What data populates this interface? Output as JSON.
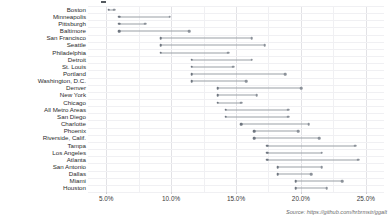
{
  "chart_data": {
    "type": "dumbbell",
    "title": "",
    "subtitle": "",
    "xlabel": "",
    "ylabel": "",
    "xlim": [
      3.6,
      26.4
    ],
    "xticks": [
      5.0,
      10.0,
      15.0,
      20.0,
      25.0
    ],
    "xtick_labels": [
      "5.0%",
      "10.0%",
      "15.0%",
      "20.0%",
      "25.0%"
    ],
    "grid": "vertical-major-minor-and-horizontal",
    "legend_position": "none",
    "series": [
      {
        "name": "start",
        "color": "#6f7680"
      },
      {
        "name": "end",
        "color": "#8b9199"
      }
    ],
    "categories": [
      "Boston",
      "Minneapolis",
      "Pittsburgh",
      "Baltimore",
      "San Francisco",
      "Seattle",
      "Philadelphia",
      "Detroit",
      "St. Louis",
      "Portland",
      "Washington, D.C.",
      "Denver",
      "New York",
      "Chicago",
      "All Metro Areas",
      "San Diego",
      "Charlotte",
      "Phoenix",
      "Riverside, Calif.",
      "Tampa",
      "Los Angeles",
      "Atlanta",
      "San Antonio",
      "Dallas",
      "Miami",
      "Houston"
    ],
    "rows": [
      {
        "city": "Boston",
        "start": 5.2,
        "end": 5.6
      },
      {
        "city": "Minneapolis",
        "start": 6.0,
        "end": 9.9
      },
      {
        "city": "Pittsburgh",
        "start": 6.0,
        "end": 8.0
      },
      {
        "city": "Baltimore",
        "start": 6.0,
        "end": 11.4
      },
      {
        "city": "San Francisco",
        "start": 9.2,
        "end": 16.2
      },
      {
        "city": "Seattle",
        "start": 9.2,
        "end": 17.2
      },
      {
        "city": "Philadelphia",
        "start": 9.2,
        "end": 14.4
      },
      {
        "city": "Detroit",
        "start": 11.6,
        "end": 16.2
      },
      {
        "city": "St. Louis",
        "start": 11.6,
        "end": 14.8
      },
      {
        "city": "Portland",
        "start": 11.6,
        "end": 18.8
      },
      {
        "city": "Washington, D.C.",
        "start": 11.6,
        "end": 15.8
      },
      {
        "city": "Denver",
        "start": 13.6,
        "end": 20.0
      },
      {
        "city": "New York",
        "start": 13.6,
        "end": 16.6
      },
      {
        "city": "Chicago",
        "start": 13.6,
        "end": 15.4
      },
      {
        "city": "All Metro Areas",
        "start": 14.2,
        "end": 19.0
      },
      {
        "city": "San Diego",
        "start": 14.2,
        "end": 19.0
      },
      {
        "city": "Charlotte",
        "start": 15.4,
        "end": 20.6
      },
      {
        "city": "Phoenix",
        "start": 16.4,
        "end": 19.8
      },
      {
        "city": "Riverside, Calif.",
        "start": 16.4,
        "end": 21.4
      },
      {
        "city": "Tampa",
        "start": 17.4,
        "end": 24.2
      },
      {
        "city": "Los Angeles",
        "start": 17.4,
        "end": 21.6
      },
      {
        "city": "Atlanta",
        "start": 17.4,
        "end": 24.4
      },
      {
        "city": "San Antonio",
        "start": 18.2,
        "end": 21.6
      },
      {
        "city": "Dallas",
        "start": 18.2,
        "end": 20.8
      },
      {
        "city": "Miami",
        "start": 19.6,
        "end": 23.2
      },
      {
        "city": "Houston",
        "start": 19.6,
        "end": 22.0
      }
    ]
  },
  "footer": {
    "source": "Source: https://github.com/hrbrmstr/ggalt"
  }
}
